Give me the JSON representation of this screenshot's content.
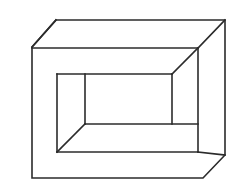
{
  "figure": {
    "label": "4.",
    "caption_text": "4.",
    "kind": "line-drawing",
    "stroke_color": "#2b2b2b",
    "fill_color": "#ffffff",
    "background_color": "#ffffff",
    "stroke_width": 1.6,
    "canvas": {
      "width": 234,
      "height": 184
    },
    "geometry": {
      "outer_outline": {
        "name": "outer-beveled-rectangle",
        "points": "56,20 225,20 225,155 203,178 32,178 32,47 56,20",
        "description": "Outer silhouette: rectangle with the top-left and bottom-right corners cut off (bevelled)."
      },
      "front_face_top_edge": {
        "name": "front-face-top-edge",
        "x1": 32,
        "y1": 48,
        "x2": 198,
        "y2": 48
      },
      "front_face_right_edge": {
        "name": "front-face-right-edge",
        "x1": 198,
        "y1": 48,
        "x2": 198,
        "y2": 152
      },
      "front_face_bottom_edge": {
        "name": "front-face-bottom-edge",
        "x1": 57,
        "y1": 152,
        "x2": 198,
        "y2": 152
      },
      "top_left_bevel_receding_edge": {
        "name": "top-left-receding-edge",
        "x1": 32,
        "y1": 47,
        "x2": 56,
        "y2": 20
      },
      "top_right_receding_edge": {
        "name": "top-right-receding-edge",
        "x1": 198,
        "y1": 48,
        "x2": 225,
        "y2": 20
      },
      "bottom_right_receding_edge": {
        "name": "bottom-right-receding-edge",
        "x1": 198,
        "y1": 152,
        "x2": 225,
        "y2": 155
      },
      "aperture_top_edge": {
        "name": "aperture-top-edge",
        "x1": 57,
        "y1": 74,
        "x2": 172,
        "y2": 74
      },
      "aperture_left_edge": {
        "name": "aperture-left-edge",
        "x1": 57,
        "y1": 74,
        "x2": 57,
        "y2": 152
      },
      "aperture_inner_vertical": {
        "name": "aperture-inner-left-vertical",
        "x1": 85,
        "y1": 74,
        "x2": 85,
        "y2": 124
      },
      "aperture_inner_bottom": {
        "name": "aperture-inner-bottom-edge",
        "x1": 85,
        "y1": 124,
        "x2": 198,
        "y2": 124
      },
      "aperture_right_vertical": {
        "name": "aperture-right-vertical",
        "x1": 172,
        "y1": 74,
        "x2": 172,
        "y2": 124
      },
      "aperture_top_right_diagonal": {
        "name": "aperture-top-right-diagonal",
        "x1": 172,
        "y1": 74,
        "x2": 198,
        "y2": 48
      },
      "aperture_bottom_left_diagonal": {
        "name": "aperture-bottom-left-diagonal",
        "x1": 85,
        "y1": 124,
        "x2": 57,
        "y2": 152
      }
    }
  }
}
